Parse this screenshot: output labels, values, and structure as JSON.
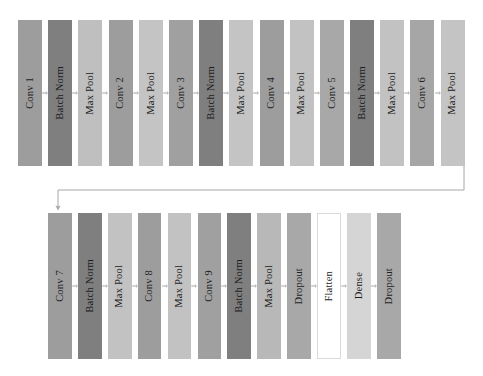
{
  "diagram": {
    "type": "neural-network-architecture",
    "background_color": "#ffffff",
    "colors": {
      "conv": "#9d9d9d",
      "batch_norm": "#7f7f7f",
      "max_pool": "#bfbfbf",
      "dropout": "#a8a8a8",
      "flatten": "#ffffff",
      "flatten_border": "#d9d9d9",
      "dense": "#d5d5d5",
      "text": "#1d1d1d",
      "connector": "#a6a6a6"
    },
    "rows": [
      {
        "name": "row-top",
        "blocks": [
          {
            "label": "Conv 1",
            "type": "conv",
            "color": "#9d9d9d"
          },
          {
            "label": "Batch Norm",
            "type": "batch_norm",
            "color": "#7f7f7f"
          },
          {
            "label": "Max Pool",
            "type": "max_pool",
            "color": "#bfbfbf"
          },
          {
            "label": "Conv 2",
            "type": "conv",
            "color": "#9d9d9d"
          },
          {
            "label": "Max Pool",
            "type": "max_pool",
            "color": "#c4c4c4"
          },
          {
            "label": "Conv 3",
            "type": "conv",
            "color": "#a0a0a0"
          },
          {
            "label": "Batch Norm",
            "type": "batch_norm",
            "color": "#7f7f7f"
          },
          {
            "label": "Max Pool",
            "type": "max_pool",
            "color": "#c4c4c4"
          },
          {
            "label": "Conv 4",
            "type": "conv",
            "color": "#9d9d9d"
          },
          {
            "label": "Max Pool",
            "type": "max_pool",
            "color": "#c2c2c2"
          },
          {
            "label": "Conv 5",
            "type": "conv",
            "color": "#a8a8a8"
          },
          {
            "label": "Batch Norm",
            "type": "batch_norm",
            "color": "#7f7f7f"
          },
          {
            "label": "Max Pool",
            "type": "max_pool",
            "color": "#c2c2c2"
          },
          {
            "label": "Conv 6",
            "type": "conv",
            "color": "#a6a6a6"
          },
          {
            "label": "Max Pool",
            "type": "max_pool",
            "color": "#c4c4c4"
          }
        ]
      },
      {
        "name": "row-bottom",
        "blocks": [
          {
            "label": "Conv 7",
            "type": "conv",
            "color": "#9d9d9d"
          },
          {
            "label": "Batch Norm",
            "type": "batch_norm",
            "color": "#7f7f7f"
          },
          {
            "label": "Max Pool",
            "type": "max_pool",
            "color": "#c2c2c2"
          },
          {
            "label": "Conv 8",
            "type": "conv",
            "color": "#9d9d9d"
          },
          {
            "label": "Max Pool",
            "type": "max_pool",
            "color": "#c2c2c2"
          },
          {
            "label": "Conv 9",
            "type": "conv",
            "color": "#a0a0a0"
          },
          {
            "label": "Batch Norm",
            "type": "batch_norm",
            "color": "#7f7f7f"
          },
          {
            "label": "Max Pool",
            "type": "max_pool",
            "color": "#b8b8b8"
          },
          {
            "label": "Dropout",
            "type": "dropout",
            "color": "#a8a8a8"
          },
          {
            "label": "Flatten",
            "type": "flatten",
            "color": "#ffffff"
          },
          {
            "label": "Dense",
            "type": "dense",
            "color": "#d5d5d5"
          },
          {
            "label": "Dropout",
            "type": "dropout",
            "color": "#a8a8a8"
          }
        ]
      }
    ],
    "connector": {
      "name": "row-wrap-connector",
      "description": "Elbow arrow from end of top row down and left into start of bottom row"
    }
  }
}
